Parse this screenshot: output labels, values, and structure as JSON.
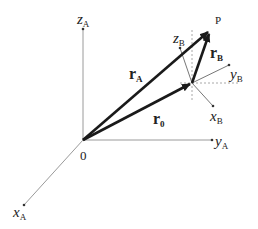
{
  "diagram": {
    "origin_label": "0",
    "point_label": "P",
    "frame_A": {
      "x_axis": {
        "label": "x",
        "sub": "A"
      },
      "y_axis": {
        "label": "y",
        "sub": "A"
      },
      "z_axis": {
        "label": "z",
        "sub": "A"
      }
    },
    "frame_B": {
      "x_axis": {
        "label": "x",
        "sub": "B"
      },
      "y_axis": {
        "label": "y",
        "sub": "B"
      },
      "z_axis": {
        "label": "z",
        "sub": "B"
      }
    },
    "vectors": {
      "r_A": {
        "label": "r",
        "sub": "A"
      },
      "r_B": {
        "label": "r",
        "sub": "B"
      },
      "r_0": {
        "label": "r",
        "sub": "0"
      }
    },
    "colors": {
      "axis": "#8a8a8a",
      "vector": "#1a1a1a",
      "dashed_guide": "#a0a0a0",
      "text": "#222222"
    }
  }
}
